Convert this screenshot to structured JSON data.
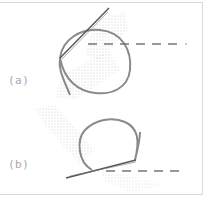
{
  "figure": {
    "panels": [
      {
        "id": "a",
        "label": "(a)"
      },
      {
        "id": "b",
        "label": "(b)"
      }
    ],
    "colors": {
      "loop": "#8a8a8a",
      "rod": "#555555",
      "dashed": "#777777",
      "cloud": "#c8c8c8",
      "frame": "#d8d8d8",
      "label": "#a8a8a8"
    }
  }
}
